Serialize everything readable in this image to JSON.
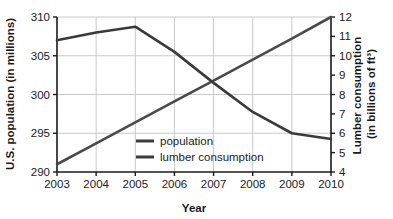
{
  "chart_data": {
    "type": "line",
    "title": "",
    "xlabel": "Year",
    "ylabel": "U.S. population (in millions)",
    "y2label": "Lumber consumption (in billions of ft³)",
    "x": [
      2003,
      2004,
      2005,
      2006,
      2007,
      2008,
      2009,
      2010
    ],
    "categories": [
      "2003",
      "2004",
      "2005",
      "2006",
      "2007",
      "2008",
      "2009",
      "2010"
    ],
    "xlim": [
      2003,
      2010
    ],
    "ylim": [
      290,
      310
    ],
    "y2lim": [
      4,
      12
    ],
    "yticks": [
      290,
      295,
      300,
      305,
      310
    ],
    "ytick_labels": [
      "290",
      "295",
      "300",
      "305",
      "310"
    ],
    "y2ticks": [
      4,
      5,
      6,
      7,
      8,
      9,
      10,
      11,
      12
    ],
    "y2tick_labels": [
      "4",
      "5",
      "6",
      "7",
      "8",
      "9",
      "10",
      "11",
      "12"
    ],
    "grid": true,
    "legend_position": "center-bottom-inside",
    "series": [
      {
        "name": "population",
        "axis": "left",
        "units": "millions",
        "color": "#4a4a4a",
        "values": [
          291.0,
          293.7,
          296.4,
          299.1,
          301.8,
          304.5,
          307.2,
          310.0
        ]
      },
      {
        "name": "lumber consumption",
        "axis": "right",
        "units": "billions of ft³",
        "color": "#3a3a3a",
        "values": [
          10.8,
          11.2,
          11.5,
          10.2,
          8.6,
          7.1,
          6.0,
          5.7
        ]
      }
    ]
  },
  "legend": {
    "items": [
      {
        "label": "population"
      },
      {
        "label": "lumber consumption"
      }
    ]
  },
  "colors": {
    "line": "#3c3c3c",
    "grid": "#c9c9c9",
    "axis": "#1a1a1a",
    "background": "#ffffff"
  }
}
